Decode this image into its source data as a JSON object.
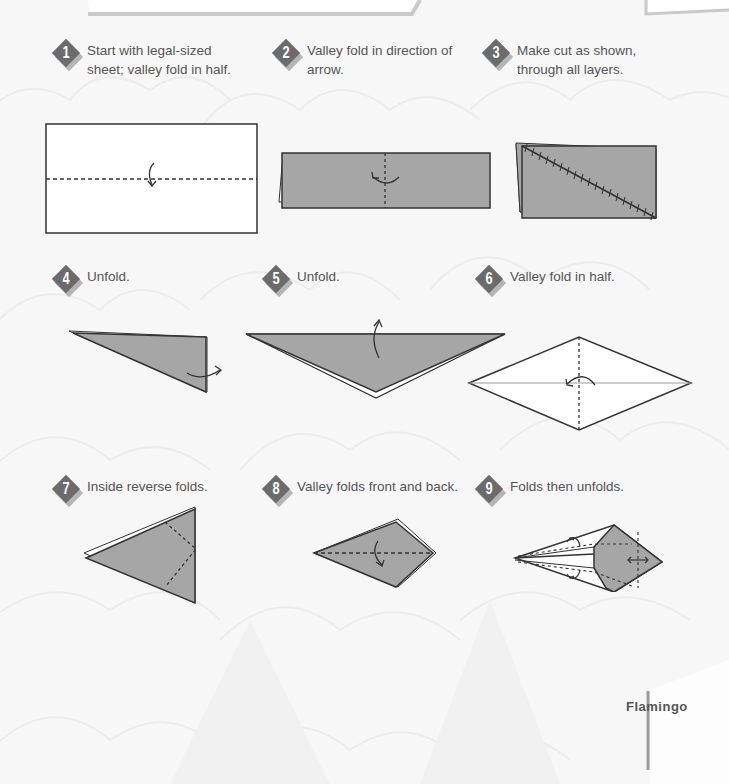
{
  "page": {
    "title": "Flamingo",
    "colors": {
      "paper_gray": "#a6a6a6",
      "badge": "#6b6b6b",
      "badge_shadow": "#b5b5b5",
      "text": "#555555",
      "background": "#f7f7f7"
    }
  },
  "steps": [
    {
      "number": "1",
      "lines": [
        "Start with legal-sized",
        "sheet; valley fold in half."
      ]
    },
    {
      "number": "2",
      "lines": [
        "Valley fold in direction of",
        "arrow."
      ]
    },
    {
      "number": "3",
      "lines": [
        "Make cut as shown,",
        "through all layers."
      ]
    },
    {
      "number": "4",
      "lines": [
        "Unfold."
      ]
    },
    {
      "number": "5",
      "lines": [
        "Unfold."
      ]
    },
    {
      "number": "6",
      "lines": [
        "Valley fold in half."
      ]
    },
    {
      "number": "7",
      "lines": [
        "Inside reverse folds."
      ]
    },
    {
      "number": "8",
      "lines": [
        "Valley folds front and back."
      ]
    },
    {
      "number": "9",
      "lines": [
        "Folds then unfolds."
      ]
    }
  ],
  "footer": {
    "title": "Flamingo"
  }
}
